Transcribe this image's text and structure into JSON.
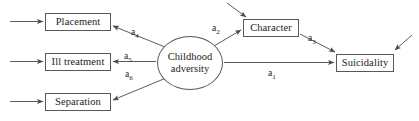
{
  "diagram": {
    "type": "path-diagram",
    "stroke_color": "#58585a",
    "text_color": "#1b1b1b",
    "background_color": "#ffffff",
    "nodes": [
      {
        "id": "placement",
        "label": "Placement",
        "shape": "rect",
        "x": 45,
        "y": 13,
        "w": 66,
        "h": 18
      },
      {
        "id": "ill-treatment",
        "label": "Ill treatment",
        "shape": "rect",
        "x": 45,
        "y": 53,
        "w": 66,
        "h": 18
      },
      {
        "id": "separation",
        "label": "Separation",
        "shape": "rect",
        "x": 45,
        "y": 93,
        "w": 66,
        "h": 18
      },
      {
        "id": "childhood-adversity",
        "label_line1": "Childhood",
        "label_line2": "adversity",
        "shape": "ellipse",
        "x": 157,
        "y": 36,
        "w": 66,
        "h": 54
      },
      {
        "id": "character",
        "label": "Character",
        "shape": "rect",
        "x": 243,
        "y": 19,
        "w": 56,
        "h": 18
      },
      {
        "id": "suicidality",
        "label": "Suicidality",
        "shape": "rect",
        "x": 336,
        "y": 54,
        "w": 58,
        "h": 18
      }
    ],
    "edges": [
      {
        "id": "a4",
        "label": "a",
        "sub": "4",
        "from": "childhood-adversity",
        "to": "placement",
        "label_x": 131,
        "label_y": 28
      },
      {
        "id": "a5",
        "label": "a",
        "sub": "5",
        "from": "childhood-adversity",
        "to": "ill-treatment",
        "label_x": 124,
        "label_y": 52
      },
      {
        "id": "a6",
        "label": "a",
        "sub": "6",
        "from": "childhood-adversity",
        "to": "separation",
        "label_x": 125,
        "label_y": 70
      },
      {
        "id": "a2",
        "label": "a",
        "sub": "2",
        "from": "childhood-adversity",
        "to": "character",
        "label_x": 212,
        "label_y": 24
      },
      {
        "id": "a3",
        "label": "a",
        "sub": "3",
        "from": "character",
        "to": "suicidality",
        "label_x": 308,
        "label_y": 34
      },
      {
        "id": "a1",
        "label": "a",
        "sub": "1",
        "from": "childhood-adversity",
        "to": "suicidality",
        "label_x": 268,
        "label_y": 69
      }
    ],
    "exogenous_arrows": [
      {
        "id": "into-placement",
        "target": "placement"
      },
      {
        "id": "into-ill-treatment",
        "target": "ill-treatment"
      },
      {
        "id": "into-separation",
        "target": "separation"
      },
      {
        "id": "into-character",
        "target": "character"
      },
      {
        "id": "into-suicidality",
        "target": "suicidality"
      }
    ]
  }
}
